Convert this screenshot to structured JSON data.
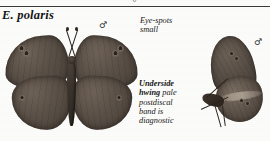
{
  "plate": {
    "species_name": "E. polaris",
    "top_symbol": "♂",
    "divider": "horizontal-rule"
  },
  "specimens": [
    {
      "id": "dorsal",
      "view": "dorsal-spread",
      "sex_symbol": "♂",
      "description": "spread male upperside, dark brown wings with small ocelli"
    },
    {
      "id": "ventral",
      "view": "lateral-underside",
      "sex_symbol": "♂",
      "description": "lateral male underside showing pale postdiscal band on hindwing"
    }
  ],
  "annotations": {
    "eyespots": {
      "line1": "Eye-spots",
      "line2": "small"
    },
    "underside": {
      "lead": "Underside",
      "lead2": "hwing",
      "rest": " pale postdiscal band is diagnostic"
    }
  },
  "colors": {
    "paper": "#fcfcfa",
    "ink": "#141414",
    "wing_dark": "#473f38",
    "wing_mid": "#5a5047",
    "wing_light": "#6e6257",
    "pale_band": "#c4b9aa"
  }
}
